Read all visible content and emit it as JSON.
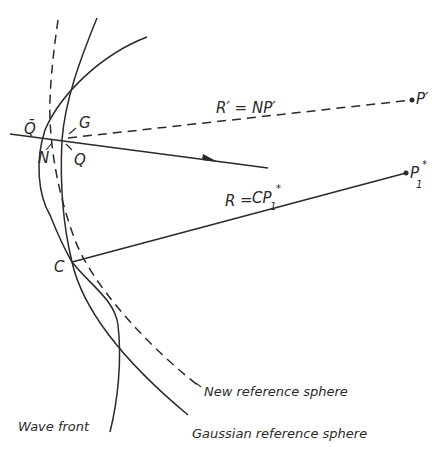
{
  "diagram": {
    "type": "optics-wavefront-reference-spheres",
    "points": {
      "Q_bar": "Q̄",
      "G": "G",
      "N": "N",
      "Q": "Q",
      "C": "C",
      "P_prime": "P′",
      "P1_star_base": "P",
      "P1_star_sub": "1",
      "P1_star_sup": "*"
    },
    "equations": {
      "r_prime": "R′ = NP′",
      "r_prime_left": "R′",
      "r_prime_eq": "=",
      "r_prime_right": "NP′",
      "r": "R = CP₁*",
      "r_left": "R",
      "r_eq": "=",
      "r_right_base": "CP",
      "r_right_sub": "1",
      "r_right_sup": "*"
    },
    "curve_labels": {
      "new_reference_sphere": "New reference sphere",
      "gaussian_reference_sphere": "Gaussian reference sphere",
      "wave_front": "Wave front"
    },
    "colors": {
      "ink": "#2a2a2a",
      "background": "#ffffff"
    }
  }
}
